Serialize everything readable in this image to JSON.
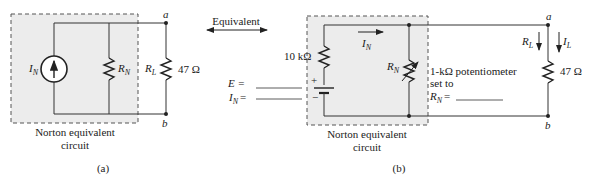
{
  "figure_a": {
    "box_caption_line1": "Norton equivalent",
    "box_caption_line2": "circuit",
    "source_label": "I",
    "source_sub": "N",
    "rn_label": "R",
    "rn_sub": "N",
    "rl_label": "R",
    "rl_sub": "L",
    "rl_value": "47 Ω",
    "node_a": "a",
    "node_b": "b",
    "caption": "(a)"
  },
  "arrow": {
    "label": "Equivalent"
  },
  "figure_b": {
    "resistor_value": "10 kΩ",
    "e_label": "E =",
    "in_label": "I",
    "in_sub": "N",
    "in_eq": "=",
    "current_arrow_label": "I",
    "current_arrow_sub": "N",
    "rn_label": "R",
    "rn_sub": "N",
    "pot_line1": "1-kΩ potentiometer",
    "pot_line2": "set to",
    "pot_line3_label": "R",
    "pot_line3_sub": "N",
    "pot_line3_eq": "=",
    "rl_arrow_label": "R",
    "rl_arrow_sub": "L",
    "il_label": "I",
    "il_sub": "L",
    "rl_value": "47 Ω",
    "node_a": "a",
    "node_b": "b",
    "box_caption_line1": "Norton equivalent",
    "box_caption_line2": "circuit",
    "caption": "(b)",
    "plus": "+",
    "minus": "−"
  },
  "colors": {
    "shade": "#ececec",
    "wire": "#333333",
    "dash": "#555555"
  }
}
